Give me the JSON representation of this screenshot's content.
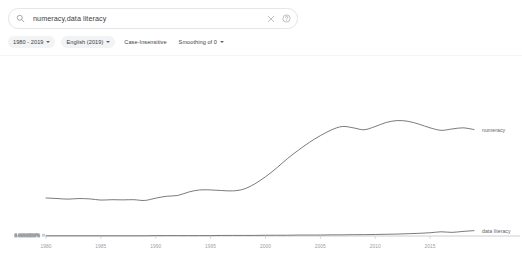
{
  "search": {
    "value": "numeracy,data literacy",
    "placeholder": "Search in Google Books Ngram Viewer",
    "search_icon": "search-icon",
    "clear_icon": "close-icon",
    "help_icon": "help-circle-icon"
  },
  "filters": {
    "date_range": "1980 - 2019",
    "corpus": "English (2019)",
    "case_sensitivity": "Case-Insensitive",
    "smoothing": "Smoothing of 0"
  },
  "chart_data": {
    "type": "line",
    "title": "",
    "xlabel": "",
    "ylabel": "",
    "grid": false,
    "legend_position": "right-inline",
    "xlim": [
      1980,
      2019
    ],
    "ylim": [
      0,
      9e-05
    ],
    "xticks": [
      "1980",
      "1985",
      "1990",
      "1995",
      "2000",
      "2005",
      "2010",
      "2015"
    ],
    "xtick_values": [
      1980,
      1985,
      1990,
      1995,
      2000,
      2005,
      2010,
      2015
    ],
    "yticks": [
      "0.0000900%",
      "0.0000800%",
      "0.0000700%",
      "0.0000600%",
      "0.0000500%",
      "0.0000400%",
      "0.0000300%",
      "0.0000200%",
      "0.0000100%",
      "0.0000000%"
    ],
    "ytick_values": [
      9e-07,
      8e-07,
      7e-07,
      6e-07,
      5e-07,
      4e-07,
      3e-07,
      2e-07,
      1e-07,
      0
    ],
    "x": [
      1980,
      1981,
      1982,
      1983,
      1984,
      1985,
      1986,
      1987,
      1988,
      1989,
      1990,
      1991,
      1992,
      1993,
      1994,
      1995,
      1996,
      1997,
      1998,
      1999,
      2000,
      2001,
      2002,
      2003,
      2004,
      2005,
      2006,
      2007,
      2008,
      2009,
      2010,
      2011,
      2012,
      2013,
      2014,
      2015,
      2016,
      2017,
      2018,
      2019
    ],
    "series": [
      {
        "name": "numeracy",
        "color": "#5f6368",
        "label_x": 2019,
        "values": [
          1.99e-05,
          1.96e-05,
          1.93e-05,
          1.96e-05,
          1.94e-05,
          1.88e-05,
          1.9e-05,
          1.89e-05,
          1.9e-05,
          1.86e-05,
          1.98e-05,
          2.08e-05,
          2.12e-05,
          2.3e-05,
          2.41e-05,
          2.41e-05,
          2.38e-05,
          2.36e-05,
          2.45e-05,
          2.72e-05,
          3.1e-05,
          3.55e-05,
          4.05e-05,
          4.49e-05,
          4.9e-05,
          5.25e-05,
          5.55e-05,
          5.73e-05,
          5.66e-05,
          5.56e-05,
          5.73e-05,
          5.94e-05,
          6.04e-05,
          6e-05,
          5.85e-05,
          5.66e-05,
          5.53e-05,
          5.6e-05,
          5.66e-05,
          5.57e-05
        ]
      },
      {
        "name": "data literacy",
        "color": "#5f6368",
        "label_x": 2019,
        "values": [
          1e-07,
          1e-07,
          1e-07,
          1e-07,
          1e-07,
          1e-07,
          1e-07,
          1e-07,
          1e-07,
          1e-07,
          2e-07,
          2e-07,
          2e-07,
          2e-07,
          2e-07,
          2e-07,
          3e-07,
          3e-07,
          3e-07,
          3e-07,
          4e-07,
          4e-07,
          4e-07,
          5e-07,
          5e-07,
          5e-07,
          6e-07,
          6e-07,
          7e-07,
          7e-07,
          8e-07,
          9e-07,
          1e-06,
          1.2e-06,
          1.4e-06,
          1.7e-06,
          2.2e-06,
          1.9e-06,
          2.4e-06,
          2.8e-06
        ]
      }
    ]
  }
}
